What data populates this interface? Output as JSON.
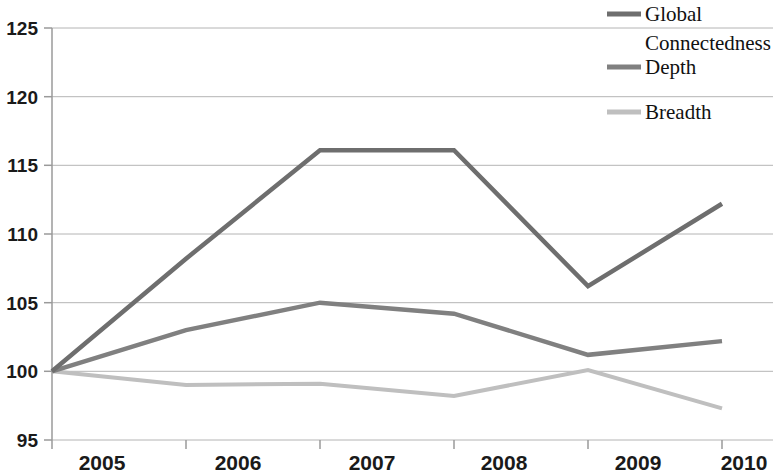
{
  "chart_data": {
    "type": "line",
    "title": "",
    "subtitle": "",
    "xlabel": "",
    "ylabel": "",
    "categories": [
      "2005",
      "2006",
      "2007",
      "2008",
      "2009",
      "2010"
    ],
    "x": [
      2005,
      2006,
      2007,
      2008,
      2009,
      2010
    ],
    "xlim": [
      2005,
      2010
    ],
    "ylim": [
      95,
      125
    ],
    "yticks": [
      95,
      100,
      105,
      110,
      115,
      120,
      125
    ],
    "ytick_labels": [
      "95",
      "100",
      "105",
      "110",
      "115",
      "120",
      "125"
    ],
    "grid": true,
    "grid_axis": "y",
    "legend_position": "top-right",
    "series": [
      {
        "name": "Global Connectedness",
        "color": "#6e6e6e",
        "values": [
          100,
          108.2,
          116.1,
          116.1,
          106.2,
          112.2
        ]
      },
      {
        "name": "Depth",
        "color": "#808080",
        "values": [
          100,
          103.0,
          105.0,
          104.2,
          101.2,
          102.2
        ]
      },
      {
        "name": "Breadth",
        "color": "#bfbfbf",
        "values": [
          100,
          99.0,
          99.1,
          98.2,
          100.1,
          97.3
        ]
      }
    ]
  },
  "legend": {
    "items": [
      {
        "label": "Global",
        "label2": "Connectedness",
        "color": "#6e6e6e"
      },
      {
        "label": "Depth",
        "label2": "",
        "color": "#808080"
      },
      {
        "label": "Breadth",
        "label2": "",
        "color": "#bfbfbf"
      }
    ]
  },
  "axes": {
    "y_labels": [
      "125",
      "120",
      "115",
      "110",
      "105",
      "100",
      "95"
    ],
    "x_labels": [
      "2005",
      "2006",
      "2007",
      "2008",
      "2009",
      "2010"
    ]
  }
}
